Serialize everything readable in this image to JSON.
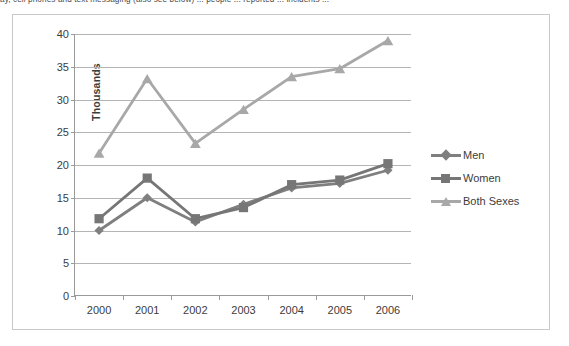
{
  "document": {
    "clipped_top_text": "ay, cell phones and text messaging (also see below) ... people ... reported ... incidents ..."
  },
  "chart_data": {
    "type": "line",
    "title": "",
    "xlabel": "",
    "ylabel": "Thousands",
    "categories": [
      "2000",
      "2001",
      "2002",
      "2003",
      "2004",
      "2005",
      "2006"
    ],
    "ylim": [
      0,
      40
    ],
    "ytick_step": 5,
    "ytick_labels": [
      "0",
      "5",
      "10",
      "15",
      "20",
      "25",
      "30",
      "35",
      "40"
    ],
    "grid": true,
    "grid_axis": "y",
    "legend_position": "right",
    "series": [
      {
        "name": "Men",
        "marker": "diamond",
        "color": "#7f7f7f",
        "values": [
          10.0,
          15.0,
          11.3,
          14.0,
          16.5,
          17.2,
          19.2
        ]
      },
      {
        "name": "Women",
        "marker": "square",
        "color": "#767676",
        "values": [
          11.8,
          18.0,
          11.8,
          13.5,
          17.0,
          17.7,
          20.2
        ]
      },
      {
        "name": "Both Sexes",
        "marker": "triangle",
        "color": "#a8a8a8",
        "values": [
          21.8,
          33.2,
          23.3,
          28.5,
          33.5,
          34.7,
          39.0
        ]
      }
    ]
  },
  "legend": {
    "items": [
      {
        "label": "Men"
      },
      {
        "label": "Women"
      },
      {
        "label": "Both Sexes"
      }
    ]
  },
  "colors": {
    "frame_border": "#c9c9c9",
    "axis_line": "#9a9a9a",
    "gridline": "#b5b5b5",
    "text": "#3c3c3c",
    "background": "#ffffff"
  }
}
